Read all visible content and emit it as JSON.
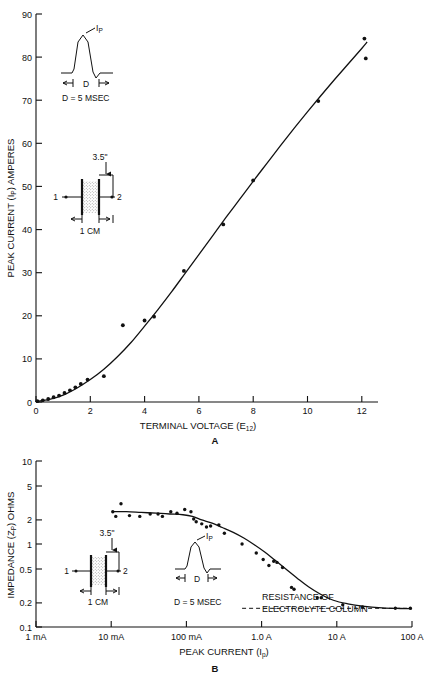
{
  "figure": {
    "panel_a_label": "A",
    "panel_b_label": "B"
  },
  "chart_data": [
    {
      "type": "scatter",
      "panel": "A",
      "title": "",
      "xlabel": "TERMINAL VOLTAGE (E12)",
      "xlabel_main": "TERMINAL VOLTAGE (E",
      "xlabel_sub": "12",
      "xlabel_tail": ")",
      "ylabel": "PEAK CURRENT (IP) AMPERES",
      "ylabel_main": "PEAK CURRENT (I",
      "ylabel_sub": "P",
      "ylabel_tail": ") AMPERES",
      "xscale": "linear",
      "yscale": "linear",
      "xlim": [
        0,
        12.6
      ],
      "ylim": [
        0,
        90
      ],
      "xticks": [
        "0",
        "2",
        "4",
        "6",
        "8",
        "10",
        "12"
      ],
      "xtick_values": [
        0,
        2,
        4,
        6,
        8,
        10,
        12
      ],
      "yticks": [
        "0",
        "10",
        "20",
        "30",
        "40",
        "50",
        "60",
        "70",
        "80",
        "90"
      ],
      "ytick_values": [
        0,
        10,
        20,
        30,
        40,
        50,
        60,
        70,
        80,
        90
      ],
      "grid": false,
      "legend": "none",
      "points": [
        [
          0.05,
          0.2
        ],
        [
          0.25,
          0.4
        ],
        [
          0.45,
          0.7
        ],
        [
          0.65,
          1.1
        ],
        [
          0.85,
          1.5
        ],
        [
          1.05,
          2.1
        ],
        [
          1.25,
          2.7
        ],
        [
          1.45,
          3.4
        ],
        [
          1.65,
          4.2
        ],
        [
          1.9,
          5.2
        ],
        [
          2.5,
          6.0
        ],
        [
          3.2,
          17.8
        ],
        [
          4.0,
          18.9
        ],
        [
          4.35,
          19.8
        ],
        [
          5.45,
          30.4
        ],
        [
          6.9,
          41.2
        ],
        [
          8.0,
          51.4
        ],
        [
          10.4,
          69.8
        ],
        [
          12.1,
          84.3
        ],
        [
          12.15,
          79.7
        ]
      ],
      "fit_curve": [
        [
          0.0,
          0.1
        ],
        [
          0.5,
          0.6
        ],
        [
          1.0,
          1.6
        ],
        [
          1.5,
          3.2
        ],
        [
          2.0,
          5.2
        ],
        [
          2.5,
          7.6
        ],
        [
          3.0,
          10.5
        ],
        [
          3.5,
          13.8
        ],
        [
          4.0,
          17.6
        ],
        [
          4.5,
          21.5
        ],
        [
          5.0,
          25.6
        ],
        [
          5.5,
          29.9
        ],
        [
          6.0,
          34.2
        ],
        [
          6.5,
          38.5
        ],
        [
          7.0,
          42.8
        ],
        [
          7.5,
          47.0
        ],
        [
          8.0,
          51.2
        ],
        [
          8.5,
          55.3
        ],
        [
          9.0,
          59.4
        ],
        [
          9.5,
          63.4
        ],
        [
          10.0,
          67.3
        ],
        [
          10.5,
          71.1
        ],
        [
          11.0,
          74.8
        ],
        [
          11.5,
          78.4
        ],
        [
          12.0,
          82.0
        ],
        [
          12.2,
          83.5
        ]
      ],
      "insets": [
        {
          "name": "pulse-waveform",
          "peak_label": "IP",
          "peak_label_main": "I",
          "peak_label_sub": "P",
          "duration_label": "D",
          "caption": "D = 5 MSEC"
        },
        {
          "name": "electrolyte-column",
          "height_label": "3.5\"",
          "width_label": "1 CM",
          "terminal_1": "1",
          "terminal_2": "2"
        }
      ]
    },
    {
      "type": "scatter",
      "panel": "B",
      "title": "",
      "xlabel": "PEAK CURRENT (Ip)",
      "xlabel_main": "PEAK CURRENT (I",
      "xlabel_sub": "p",
      "xlabel_tail": ")",
      "ylabel": "IMPEDANCE (ZP) OHMS",
      "ylabel_main": "IMPEDANCE (Z",
      "ylabel_sub": "P",
      "ylabel_tail": ") OHMS",
      "xscale": "log",
      "yscale": "log",
      "xlim": [
        0.001,
        100
      ],
      "ylim": [
        0.1,
        10
      ],
      "xticks": [
        "1 mA",
        "10 mA",
        "100 mA",
        "1.0 A",
        "10 A",
        "100 A"
      ],
      "xtick_values": [
        0.001,
        0.01,
        0.1,
        1.0,
        10,
        100
      ],
      "yticks": [
        "10",
        "5",
        "2",
        "1",
        "0.5",
        "0.2",
        "0.1"
      ],
      "ytick_values": [
        10,
        5,
        2,
        1,
        0.5,
        0.2,
        0.1
      ],
      "grid": false,
      "legend": "none",
      "points": [
        [
          0.0105,
          2.45
        ],
        [
          0.0115,
          2.15
        ],
        [
          0.0135,
          3.05
        ],
        [
          0.0175,
          2.2
        ],
        [
          0.024,
          2.15
        ],
        [
          0.033,
          2.3
        ],
        [
          0.042,
          2.3
        ],
        [
          0.048,
          2.15
        ],
        [
          0.062,
          2.45
        ],
        [
          0.075,
          2.35
        ],
        [
          0.095,
          2.6
        ],
        [
          0.115,
          2.45
        ],
        [
          0.125,
          2.0
        ],
        [
          0.135,
          1.85
        ],
        [
          0.16,
          1.75
        ],
        [
          0.185,
          1.6
        ],
        [
          0.21,
          1.65
        ],
        [
          0.27,
          1.7
        ],
        [
          0.32,
          1.35
        ],
        [
          0.55,
          1.0
        ],
        [
          0.85,
          0.78
        ],
        [
          1.05,
          0.65
        ],
        [
          1.25,
          0.55
        ],
        [
          1.45,
          0.62
        ],
        [
          1.6,
          0.6
        ],
        [
          1.9,
          0.52
        ],
        [
          2.5,
          0.3
        ],
        [
          2.7,
          0.285
        ],
        [
          5.5,
          0.225
        ],
        [
          6.2,
          0.225
        ],
        [
          12.0,
          0.185
        ],
        [
          22.0,
          0.175
        ],
        [
          60.0,
          0.168
        ],
        [
          95.0,
          0.168
        ]
      ],
      "fit_curve": [
        [
          0.0105,
          2.45
        ],
        [
          0.016,
          2.45
        ],
        [
          0.025,
          2.4
        ],
        [
          0.04,
          2.35
        ],
        [
          0.06,
          2.3
        ],
        [
          0.09,
          2.25
        ],
        [
          0.12,
          2.15
        ],
        [
          0.16,
          1.95
        ],
        [
          0.22,
          1.78
        ],
        [
          0.3,
          1.58
        ],
        [
          0.42,
          1.38
        ],
        [
          0.58,
          1.18
        ],
        [
          0.8,
          0.98
        ],
        [
          1.1,
          0.8
        ],
        [
          1.5,
          0.64
        ],
        [
          2.1,
          0.5
        ],
        [
          3.0,
          0.385
        ],
        [
          4.2,
          0.305
        ],
        [
          6.0,
          0.25
        ],
        [
          9.0,
          0.21
        ],
        [
          14.0,
          0.19
        ],
        [
          22.0,
          0.178
        ],
        [
          40.0,
          0.17
        ],
        [
          70.0,
          0.167
        ],
        [
          100.0,
          0.166
        ]
      ],
      "annotation": {
        "name": "resistance-of-electrolyte-column",
        "line1": "RESISTANCE OF",
        "line2": "ELECTROLYTE COLUMN",
        "asymptote_value": 0.168,
        "dashed_from": 0.55,
        "dashed_to": 100
      },
      "insets": [
        {
          "name": "electrolyte-column",
          "height_label": "3.5\"",
          "width_label": "1 CM",
          "terminal_1": "1",
          "terminal_2": "2"
        },
        {
          "name": "pulse-waveform",
          "peak_label": "IP",
          "peak_label_main": "I",
          "peak_label_sub": "P",
          "duration_label": "D",
          "caption": "D = 5 MSEC"
        }
      ]
    }
  ]
}
